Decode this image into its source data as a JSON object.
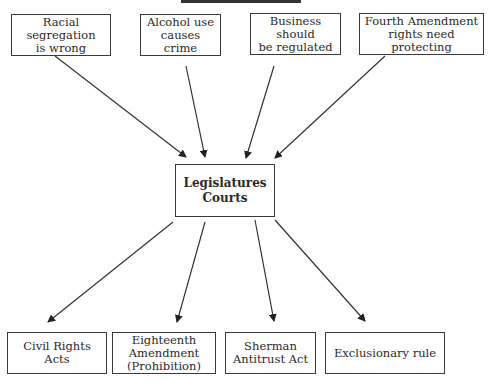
{
  "diagram": {
    "title_cropped": "",
    "sources": [
      {
        "id": "s1",
        "label": "Racial  segregation\nis wrong",
        "x": 11,
        "y": 14,
        "w": 100,
        "h": 42
      },
      {
        "id": "s2",
        "label": "Alcohol use\ncauses crime",
        "x": 140,
        "y": 14,
        "w": 81,
        "h": 42
      },
      {
        "id": "s3",
        "label": "Business should\nbe regulated",
        "x": 250,
        "y": 13,
        "w": 91,
        "h": 42
      },
      {
        "id": "s4",
        "label": "Fourth Amendment\nrights need protecting",
        "x": 359,
        "y": 13,
        "w": 125,
        "h": 42
      }
    ],
    "center": {
      "label": "Legislatures\nCourts",
      "x": 175,
      "y": 164,
      "w": 100,
      "h": 53
    },
    "outcomes": [
      {
        "id": "o1",
        "label": "Civil Rights Acts",
        "x": 7,
        "y": 332,
        "w": 100,
        "h": 42
      },
      {
        "id": "o2",
        "label": "Eighteenth\nAmendment\n(Prohibition)",
        "x": 112,
        "y": 332,
        "w": 104,
        "h": 42
      },
      {
        "id": "o3",
        "label": "Sherman\nAntitrust Act",
        "x": 225,
        "y": 332,
        "w": 91,
        "h": 42
      },
      {
        "id": "o4",
        "label": "Exclusionary rule",
        "x": 325,
        "y": 332,
        "w": 120,
        "h": 42
      }
    ],
    "edges": [
      {
        "from": "s1",
        "to": "center",
        "x1": 55,
        "y1": 56,
        "x2": 186,
        "y2": 157
      },
      {
        "from": "s2",
        "to": "center",
        "x1": 186,
        "y1": 66,
        "x2": 205,
        "y2": 157
      },
      {
        "from": "s3",
        "to": "center",
        "x1": 274,
        "y1": 66,
        "x2": 246,
        "y2": 158
      },
      {
        "from": "s4",
        "to": "center",
        "x1": 385,
        "y1": 56,
        "x2": 275,
        "y2": 158
      },
      {
        "from": "center",
        "to": "o1",
        "x1": 173,
        "y1": 222,
        "x2": 48,
        "y2": 322
      },
      {
        "from": "center",
        "to": "o2",
        "x1": 205,
        "y1": 222,
        "x2": 177,
        "y2": 322
      },
      {
        "from": "center",
        "to": "o3",
        "x1": 255,
        "y1": 220,
        "x2": 274,
        "y2": 321
      },
      {
        "from": "center",
        "to": "o4",
        "x1": 275,
        "y1": 220,
        "x2": 365,
        "y2": 321
      }
    ]
  }
}
